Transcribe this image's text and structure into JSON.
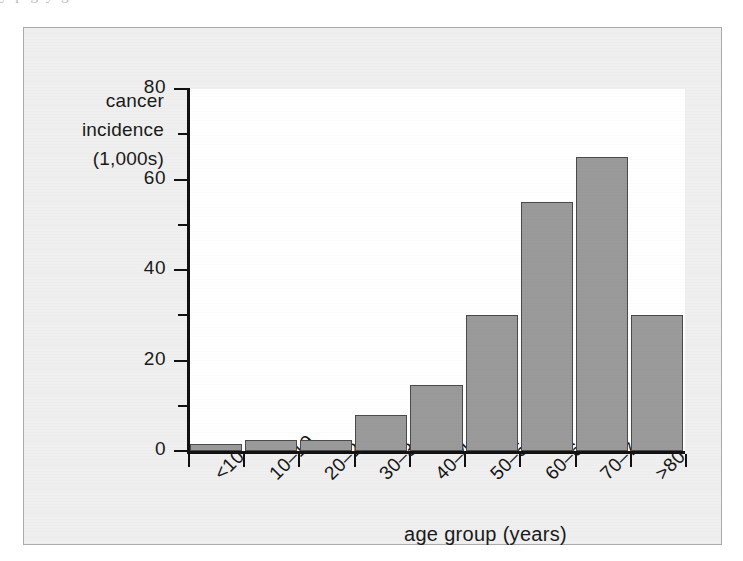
{
  "page": {
    "top_text_fragment": "y p                                    g y                                g"
  },
  "figure": {
    "plate_background": "#efefef",
    "plot_background": "#ffffff",
    "frame_color": "#aaaaaa"
  },
  "chart_data": {
    "type": "bar",
    "title": "",
    "subtitle": "",
    "xlabel": "age group (years)",
    "ylabel": "cancer incidence (1,000s)",
    "ylabel_lines": [
      "cancer",
      "incidence",
      "(1,000s)"
    ],
    "categories": [
      "<10",
      "10–19",
      "20–29",
      "30–39",
      "40–49",
      "50–59",
      "60–69",
      "70–79",
      ">80"
    ],
    "values": [
      1.5,
      2.5,
      2.5,
      8,
      14.5,
      30,
      55,
      65,
      30
    ],
    "ylim": [
      0,
      80
    ],
    "y_major_ticks": [
      0,
      20,
      40,
      60,
      80
    ],
    "y_minor_ticks": [
      10,
      30,
      50,
      70
    ],
    "y_tick_labels": [
      "0",
      "20",
      "40",
      "60",
      "80"
    ],
    "grid": false,
    "legend": "none",
    "bar_color": "#9a9a9a",
    "bar_border_color": "#4a4a4a",
    "axis_color": "#111111"
  }
}
